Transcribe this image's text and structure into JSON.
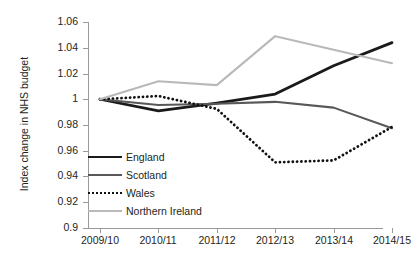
{
  "chart_title": "",
  "axes": {
    "y_title": "Index change in NHS budget",
    "y_ticks": [
      "1.06",
      "1.04",
      "1.02",
      "1",
      "0.98",
      "0.96",
      "0.94",
      "0.92",
      "0.9"
    ],
    "x_ticks": [
      "2009/10",
      "2010/11",
      "2011/12",
      "2012/13",
      "2013/14",
      "2014/15"
    ]
  },
  "legend": {
    "items": [
      {
        "label": "England",
        "color": "#1a1a1a",
        "style": "solid",
        "width": 2.6
      },
      {
        "label": "Scotland",
        "color": "#585858",
        "style": "solid",
        "width": 2.2
      },
      {
        "label": "Wales",
        "color": "#111111",
        "style": "dotted",
        "width": 2.6
      },
      {
        "label": "Northern Ireland",
        "color": "#b9b9b9",
        "style": "solid",
        "width": 2.2
      }
    ]
  },
  "chart_data": {
    "type": "line",
    "title": "",
    "xlabel": "",
    "ylabel": "Index change in NHS budget",
    "categories": [
      "2009/10",
      "2010/11",
      "2011/12",
      "2012/13",
      "2013/14",
      "2014/15"
    ],
    "ylim": [
      0.9,
      1.06
    ],
    "ytick_step": 0.02,
    "grid": false,
    "legend_position": "inside-lower-left",
    "series": [
      {
        "name": "England",
        "color": "#1a1a1a",
        "style": "solid",
        "values": [
          1.0,
          0.991,
          0.997,
          1.004,
          1.026,
          1.044
        ]
      },
      {
        "name": "Scotland",
        "color": "#585858",
        "style": "solid",
        "values": [
          1.0,
          0.9955,
          0.9965,
          0.998,
          0.9935,
          0.9775
        ]
      },
      {
        "name": "Wales",
        "color": "#111111",
        "style": "dotted",
        "values": [
          1.0,
          1.0025,
          0.9925,
          0.951,
          0.9525,
          0.9785
        ]
      },
      {
        "name": "Northern Ireland",
        "color": "#b9b9b9",
        "style": "solid",
        "values": [
          1.0,
          1.014,
          1.011,
          1.049,
          1.0385,
          1.028
        ]
      }
    ]
  }
}
